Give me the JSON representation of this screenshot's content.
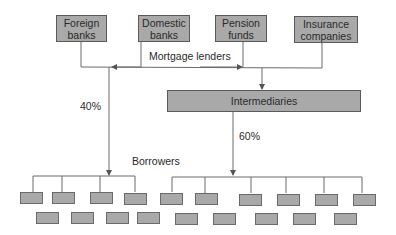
{
  "lenders": [
    {
      "id": "foreign-banks",
      "label": "Foreign banks",
      "line1": "Foreign",
      "line2": "banks"
    },
    {
      "id": "domestic-banks",
      "label": "Domestic banks",
      "line1": "Domestic",
      "line2": "banks"
    },
    {
      "id": "pension-funds",
      "label": "Pension funds",
      "line1": "Pension",
      "line2": "funds"
    },
    {
      "id": "insurance-companies",
      "label": "Insurance companies",
      "line1": "Insurance",
      "line2": "companies"
    }
  ],
  "group_label": "Mortgage lenders",
  "intermediary": {
    "label": "Intermediaries"
  },
  "flows": {
    "direct_share": "40%",
    "intermediated_share": "60%"
  },
  "borrowers_label": "Borrowers",
  "borrower_count": {
    "row1": 11,
    "row2": 10
  },
  "colors": {
    "box_fill": "#a9a9a9",
    "box_border": "#5a5a5a",
    "line": "#6a6a6a",
    "text": "#2a2a2a"
  }
}
